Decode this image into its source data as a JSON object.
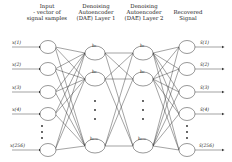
{
  "headers": {
    "input": [
      "Input",
      "- vector of",
      "signal samples"
    ],
    "layer1": [
      "Denoising",
      "Autoencoder",
      "(DAE) Layer 1"
    ],
    "layer2": [
      "Denoising",
      "Autoencoder",
      "(DAE) Layer 2"
    ],
    "output": [
      "Recovered",
      "Signal"
    ]
  },
  "input_nodes": [
    "x(1)",
    "x(2)",
    "x(3)",
    "x(4)",
    "x(256)"
  ],
  "hidden1_nodes": [
    "h₁",
    "h₂",
    "h₁₀₀"
  ],
  "hidden2_nodes": [
    "h₁",
    "h₂",
    "h₁₀₀"
  ],
  "output_nodes": [
    "x̂(1)",
    "x̂(2)",
    "x̂(3)",
    "x̂(4)",
    "x̂(256)"
  ],
  "ellipsis": "⋮",
  "colors": {
    "line": "#333333",
    "node_fill": "#ffffff",
    "text": "#222222"
  }
}
